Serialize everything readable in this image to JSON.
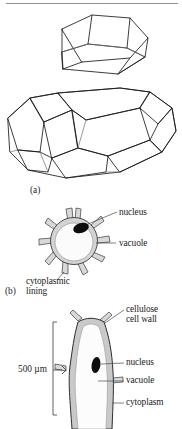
{
  "figure": {
    "panels": [
      {
        "id": "a",
        "id_label": "(a)",
        "caption": "",
        "shapes": [
          {
            "name": "hexagonal-prism-open-box",
            "description": "open hexagonal prism drawn in line art"
          },
          {
            "name": "tetrakaidecahedron",
            "description": "fourteen-sided polyhedron drawn in line art"
          }
        ]
      },
      {
        "id": "b",
        "id_label": "(b)",
        "labels": [
          {
            "key": "nucleus",
            "text": "nucleus"
          },
          {
            "key": "vacuole",
            "text": "vacuole"
          },
          {
            "key": "cytoplasmic_lining",
            "text": "cytoplasmic lining"
          }
        ]
      },
      {
        "id": "c",
        "id_label": "",
        "scale_label": "500 µm",
        "labels": [
          {
            "key": "cellulose_cell_wall_line1",
            "text": "cellulose"
          },
          {
            "key": "cellulose_cell_wall_line2",
            "text": "cell wall"
          },
          {
            "key": "nucleus",
            "text": "nucleus"
          },
          {
            "key": "vacuole",
            "text": "vacuole"
          },
          {
            "key": "cytoplasm",
            "text": "cytoplasm"
          }
        ]
      }
    ]
  },
  "labels": {
    "panel_a_id": "(a)",
    "panel_b_id": "(b)",
    "nucleus_b": "nucleus",
    "vacuole_b": "vacuole",
    "cytoplasmic": "cytoplasmic",
    "lining": "lining",
    "cellulose": "cellulose",
    "cell_wall": "cell wall",
    "nucleus_c": "nucleus",
    "vacuole_c": "vacuole",
    "cytoplasm_c": "cytoplasm",
    "scale_500um": "500 µm"
  },
  "colors": {
    "ink": "#1a1a1a",
    "rule": "#8d8d8d",
    "leader": "#555555",
    "cell_wall_fill": "#d8d8d8",
    "cell_interior": "#fbfbfb",
    "nucleus_fill": "#0d0d0d"
  }
}
